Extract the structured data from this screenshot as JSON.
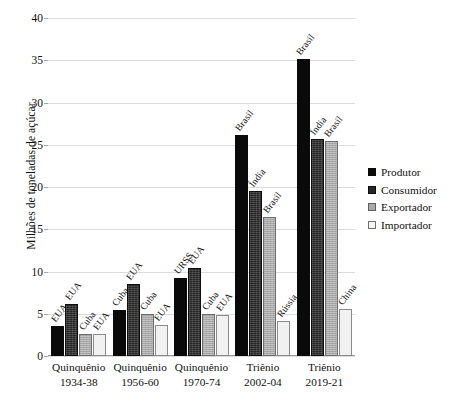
{
  "chart_data": {
    "type": "bar",
    "title": "",
    "xlabel": "",
    "ylabel": "Milhões de toneladas de açúcar",
    "ylim": [
      0,
      40
    ],
    "yticks": [
      0,
      5,
      10,
      15,
      20,
      25,
      30,
      35,
      40
    ],
    "grid": true,
    "legend_position": "right",
    "categories": [
      {
        "line1": "Quinquênio",
        "line2": "1934-38"
      },
      {
        "line1": "Quinquênio",
        "line2": "1956-60"
      },
      {
        "line1": "Quinquênio",
        "line2": "1970-74"
      },
      {
        "line1": "Triênio",
        "line2": "2002-04"
      },
      {
        "line1": "Triênio",
        "line2": "2019-21"
      }
    ],
    "series": [
      {
        "name": "Produtor",
        "color": "#0a0a0a",
        "values": [
          3.5,
          5.5,
          9.2,
          26.2,
          35.2
        ],
        "point_labels": [
          "EUA",
          "Cuba",
          "URSS",
          "Brasil",
          "Brasil"
        ]
      },
      {
        "name": "Consumidor",
        "color": "#262626",
        "values": [
          6.1,
          8.5,
          10.4,
          19.5,
          25.7
        ],
        "point_labels": [
          "EUA",
          "EUA",
          "EUA",
          "Índia",
          "Índia"
        ]
      },
      {
        "name": "Exportador",
        "color": "#a9a9a9",
        "values": [
          2.6,
          5.0,
          5.0,
          16.5,
          25.4
        ],
        "point_labels": [
          "Cuba",
          "Cuba",
          "Cuba",
          "Brasil",
          "Brasil"
        ]
      },
      {
        "name": "Importador",
        "color": "#f1f1f1",
        "values": [
          2.6,
          3.7,
          4.8,
          4.2,
          5.6
        ],
        "point_labels": [
          "EUA",
          "EUA",
          "EUA",
          "Rússia",
          "China"
        ]
      }
    ]
  }
}
